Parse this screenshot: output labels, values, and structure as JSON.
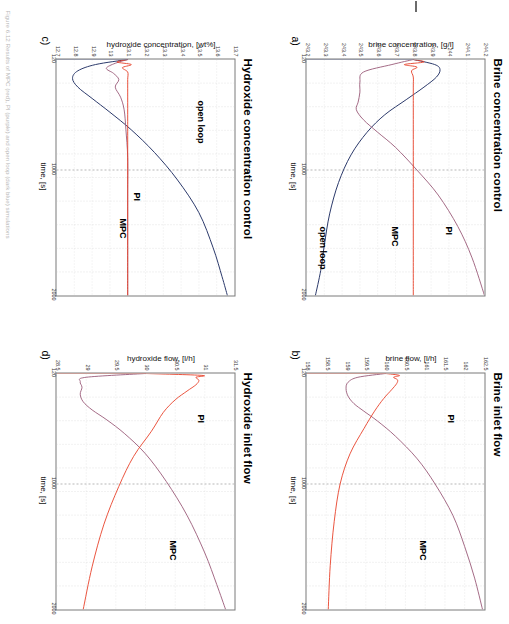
{
  "figure": {
    "caption": "Figure 6.12 Results of MPC (red), PI (purple) and open loop (dark blue) simulations",
    "colors": {
      "mpc": "#e8422a",
      "pi": "#9a5a78",
      "open_loop": "#2c3a6b",
      "axis": "#7a7a7a",
      "grid": "#c9c9c9"
    }
  },
  "panels": [
    {
      "key": "a",
      "label": "a)",
      "title": "Brine concentration control",
      "xlabel": "time, [s]",
      "ylabel": "brine concentration, [g/l]",
      "xticks": [
        "120",
        "1000",
        "2000"
      ],
      "yticks": [
        "244.2",
        "244.1",
        "244",
        "243.9",
        "243.8",
        "243.7",
        "243.6",
        "243.5",
        "243.4",
        "243.3",
        "243.2"
      ],
      "annotations": [
        {
          "text": "PI",
          "series": "pi"
        },
        {
          "text": "MPC",
          "series": "mpc"
        },
        {
          "text": "open loop",
          "series": "open_loop"
        }
      ]
    },
    {
      "key": "b",
      "label": "b)",
      "title": "Brine inlet flow",
      "xlabel": "time, [s]",
      "ylabel": "brine flow, [l/h]",
      "xticks": [
        "120",
        "1000",
        "2000"
      ],
      "yticks": [
        "162.5",
        "162",
        "161.5",
        "161",
        "160.5",
        "160",
        "159.5",
        "159",
        "158.5",
        "158"
      ],
      "annotations": [
        {
          "text": "PI",
          "series": "pi"
        },
        {
          "text": "MPC",
          "series": "mpc"
        }
      ]
    },
    {
      "key": "c",
      "label": "c)",
      "title": "Hydroxide concentration control",
      "xlabel": "time, [s]",
      "ylabel": "hydroxide concentration, [wt%]",
      "xticks": [
        "120",
        "1000",
        "2000"
      ],
      "yticks": [
        "13.7",
        "13.6",
        "13.5",
        "13.4",
        "13.3",
        "13.2",
        "13.1",
        "13",
        "12.9",
        "12.8",
        "12.7"
      ],
      "annotations": [
        {
          "text": "open loop",
          "series": "open_loop"
        },
        {
          "text": "PI",
          "series": "pi"
        },
        {
          "text": "MPC",
          "series": "mpc"
        }
      ]
    },
    {
      "key": "d",
      "label": "d)",
      "title": "Hydroxide inlet flow",
      "xlabel": "time, [s]",
      "ylabel": "hydroxide flow, [l/h]",
      "xticks": [
        "120",
        "1000",
        "2000"
      ],
      "yticks": [
        "31.5",
        "31",
        "30.5",
        "30",
        "29.5",
        "29",
        "28.5"
      ],
      "annotations": [
        {
          "text": "PI",
          "series": "pi"
        },
        {
          "text": "MPC",
          "series": "mpc"
        }
      ]
    }
  ],
  "chart_data": [
    {
      "type": "line",
      "title": "Brine concentration control",
      "panel": "a)",
      "xlabel": "time, [s]",
      "ylabel": "brine concentration, [g/l]",
      "xlim": [
        120,
        2000
      ],
      "ylim": [
        243.2,
        244.2
      ],
      "xticks": [
        120,
        1000,
        2000
      ],
      "yticks": [
        243.2,
        243.3,
        243.4,
        243.5,
        243.6,
        243.7,
        243.8,
        243.9,
        244,
        244.1,
        244.2
      ],
      "grid": true,
      "legend": "inline annotations",
      "series": [
        {
          "name": "MPC",
          "color": "#e8422a",
          "x": [
            120,
            140,
            160,
            180,
            210,
            260,
            340,
            500,
            800,
            1200,
            1600,
            2000
          ],
          "y": [
            243.8,
            243.86,
            243.75,
            243.82,
            243.79,
            243.8,
            243.8,
            243.8,
            243.8,
            243.8,
            243.8,
            243.8
          ]
        },
        {
          "name": "PI",
          "color": "#9a5a78",
          "x": [
            120,
            160,
            220,
            300,
            380,
            460,
            520,
            600,
            700,
            820,
            1000,
            1200,
            1450,
            1700,
            2000
          ],
          "y": [
            243.8,
            243.68,
            243.52,
            243.5,
            243.5,
            243.49,
            243.48,
            243.52,
            243.6,
            243.7,
            243.82,
            243.94,
            244.05,
            244.13,
            244.2
          ]
        },
        {
          "name": "open loop",
          "color": "#2c3a6b",
          "x": [
            120,
            160,
            200,
            260,
            340,
            440,
            560,
            700,
            880,
            1100,
            1350,
            1600,
            1800,
            2000
          ],
          "y": [
            243.8,
            243.92,
            243.95,
            243.93,
            243.86,
            243.76,
            243.64,
            243.54,
            243.45,
            243.38,
            243.33,
            243.3,
            243.28,
            243.25
          ]
        }
      ]
    },
    {
      "type": "line",
      "title": "Brine inlet flow",
      "panel": "b)",
      "xlabel": "time, [s]",
      "ylabel": "brine flow, [l/h]",
      "xlim": [
        120,
        2000
      ],
      "ylim": [
        158,
        162.5
      ],
      "xticks": [
        120,
        1000,
        2000
      ],
      "yticks": [
        158,
        158.5,
        159,
        159.5,
        160,
        160.5,
        161,
        161.5,
        162,
        162.5
      ],
      "grid": true,
      "legend": "inline annotations",
      "series": [
        {
          "name": "MPC",
          "color": "#e8422a",
          "x": [
            120,
            135,
            150,
            170,
            200,
            250,
            320,
            420,
            560,
            760,
            1000,
            1300,
            1650,
            2000
          ],
          "y": [
            160.0,
            160.35,
            160.2,
            160.3,
            160.28,
            160.15,
            159.95,
            159.72,
            159.45,
            159.1,
            158.85,
            158.7,
            158.6,
            158.55
          ]
        },
        {
          "name": "PI",
          "color": "#9a5a78",
          "x": [
            120,
            150,
            190,
            240,
            300,
            360,
            420,
            500,
            620,
            800,
            1000,
            1250,
            1500,
            1750,
            2000
          ],
          "y": [
            160.0,
            159.3,
            159.05,
            159.0,
            159.05,
            159.2,
            159.45,
            159.8,
            160.25,
            160.8,
            161.25,
            161.7,
            162.0,
            162.25,
            162.45
          ]
        }
      ]
    },
    {
      "type": "line",
      "title": "Hydroxide concentration control",
      "panel": "c)",
      "xlabel": "time, [s]",
      "ylabel": "hydroxide concentration, [wt%]",
      "xlim": [
        120,
        2000
      ],
      "ylim": [
        12.7,
        13.7
      ],
      "xticks": [
        120,
        1000,
        2000
      ],
      "yticks": [
        12.7,
        12.8,
        12.9,
        13,
        13.1,
        13.2,
        13.3,
        13.4,
        13.5,
        13.6,
        13.7
      ],
      "grid": true,
      "legend": "inline annotations",
      "series": [
        {
          "name": "MPC",
          "color": "#e8422a",
          "x": [
            120,
            140,
            160,
            185,
            220,
            280,
            380,
            560,
            800,
            1200,
            1600,
            2000
          ],
          "y": [
            13.1,
            13.04,
            13.12,
            13.07,
            13.1,
            13.1,
            13.1,
            13.1,
            13.1,
            13.1,
            13.1,
            13.1
          ]
        },
        {
          "name": "PI",
          "color": "#9a5a78",
          "x": [
            120,
            150,
            190,
            230,
            280,
            340,
            420,
            520,
            680,
            900,
            1200,
            1600,
            2000
          ],
          "y": [
            13.1,
            13.03,
            12.98,
            13.02,
            13.05,
            13.03,
            13.06,
            13.08,
            13.09,
            13.1,
            13.1,
            13.1,
            13.1
          ]
        },
        {
          "name": "open loop",
          "color": "#2c3a6b",
          "x": [
            120,
            160,
            210,
            270,
            340,
            430,
            540,
            680,
            860,
            1080,
            1340,
            1620,
            1850,
            2000
          ],
          "y": [
            13.1,
            12.92,
            12.82,
            12.79,
            12.82,
            12.9,
            13.0,
            13.12,
            13.25,
            13.38,
            13.5,
            13.58,
            13.63,
            13.66
          ]
        }
      ]
    },
    {
      "type": "line",
      "title": "Hydroxide inlet flow",
      "panel": "d)",
      "xlabel": "time, [s]",
      "ylabel": "hydroxide flow, [l/h]",
      "xlim": [
        120,
        2000
      ],
      "ylim": [
        28.5,
        31.5
      ],
      "xticks": [
        120,
        1000,
        2000
      ],
      "yticks": [
        28.5,
        29,
        29.5,
        30,
        30.5,
        31,
        31.5
      ],
      "grid": true,
      "legend": "inline annotations",
      "series": [
        {
          "name": "MPC",
          "color": "#e8422a",
          "x": [
            120,
            135,
            150,
            175,
            210,
            260,
            330,
            430,
            580,
            780,
            1020,
            1320,
            1660,
            2000
          ],
          "y": [
            30.0,
            30.95,
            30.85,
            30.9,
            30.85,
            30.7,
            30.5,
            30.3,
            30.1,
            29.8,
            29.55,
            29.3,
            29.1,
            28.95
          ]
        },
        {
          "name": "PI",
          "color": "#9a5a78",
          "x": [
            120,
            150,
            185,
            230,
            285,
            345,
            410,
            490,
            600,
            760,
            980,
            1250,
            1550,
            1800,
            2000
          ],
          "y": [
            30.0,
            29.0,
            28.9,
            28.93,
            28.9,
            28.95,
            29.1,
            29.35,
            29.65,
            30.0,
            30.35,
            30.7,
            31.0,
            31.2,
            31.35
          ]
        }
      ]
    }
  ]
}
